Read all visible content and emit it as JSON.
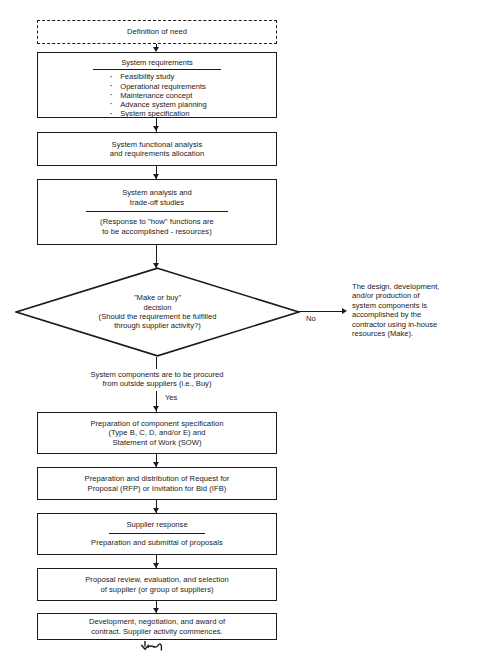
{
  "diagram": {
    "type": "flowchart",
    "nodes": {
      "definition_of_need": {
        "label": "Definition of need",
        "shape": "dashed-rectangle"
      },
      "system_requirements": {
        "title": "System requirements",
        "shape": "rectangle-with-divider",
        "bullets": [
          "Feasibility study",
          "Operational requirements",
          "Maintenance concept",
          "Advance system planning",
          "System specification"
        ]
      },
      "functional_analysis": {
        "label": "System functional analysis\nand requirements allocation",
        "shape": "rectangle"
      },
      "system_analysis": {
        "title": "System analysis and\ntrade-off studies",
        "body": "(Response to \"how\" functions are\nto be accomplished - resources)",
        "shape": "rectangle-with-divider"
      },
      "make_or_buy_decision": {
        "label": "\"Make or buy\"\ndecision\n(Should the requirement be fulfilled\nthrough supplier activity?)",
        "shape": "diamond"
      },
      "make_outcome": {
        "label": "The design, development,\nand/or production of\nsystem components is\naccomplished by the\ncontractor using in-house\nresources (Make).",
        "shape": "free-text"
      },
      "buy_note": {
        "label": "System components are to be procured\nfrom outside suppliers (i.e., Buy)",
        "shape": "free-text"
      },
      "component_specification": {
        "label": "Preparation of component specification\n(Type B, C, D, and/or E) and\nStatement of Work (SOW)",
        "shape": "rectangle"
      },
      "rfp_distribution": {
        "label": "Preparation and distribution of Request for\nProposal (RFP) or Invitation for Bid (IFB)",
        "shape": "rectangle"
      },
      "supplier_response": {
        "title": "Supplier response",
        "body": "Preparation and submittal of proposals",
        "shape": "rectangle-with-divider"
      },
      "proposal_review": {
        "label": "Proposal review, evaluation, and selection\nof supplier (or group of suppliers)",
        "shape": "rectangle"
      },
      "contract_award": {
        "label": "Development, negotiation, and award of\ncontract.  Supplier activity commences.",
        "shape": "rectangle"
      },
      "continuation": {
        "label": "",
        "shape": "squiggle-arrow"
      }
    },
    "edge_labels": {
      "no": "No",
      "yes": "Yes"
    },
    "colors": {
      "stroke": "#1a1a1a",
      "background": "#ffffff",
      "text": "#1a1a1a"
    }
  }
}
